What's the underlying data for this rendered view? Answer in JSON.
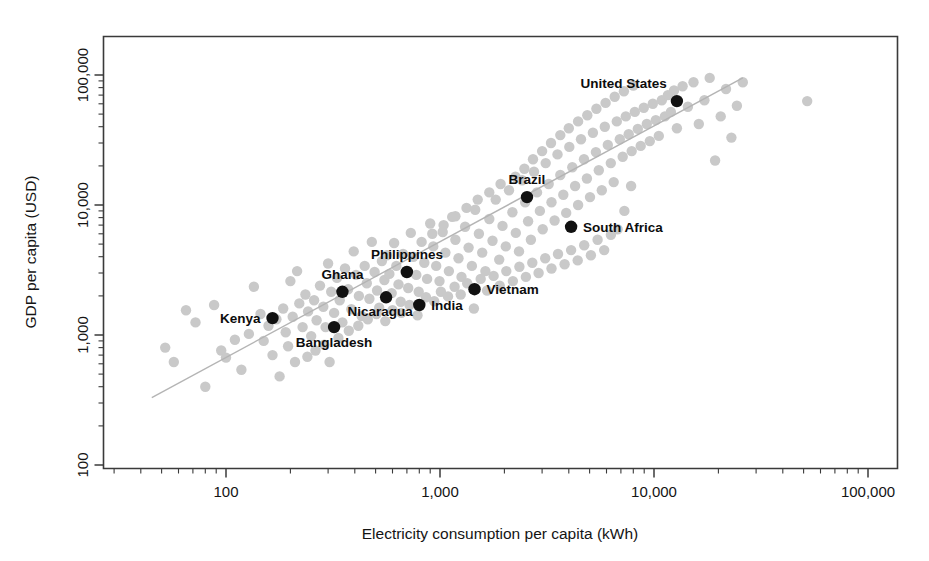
{
  "chart_data": {
    "type": "scatter",
    "title": "",
    "xlabel": "Electricity consumption per capita (kWh)",
    "ylabel": "GDP per capita (USD)",
    "xscale": "log",
    "yscale": "log",
    "xlim": [
      40,
      170000
    ],
    "ylim": [
      150,
      300000
    ],
    "grid": false,
    "legend": null,
    "x_ticks": [
      "100",
      "1,000",
      "10,000",
      "100,000"
    ],
    "x_tick_values": [
      100,
      1000,
      10000,
      100000
    ],
    "y_ticks": [
      "100",
      "1,000",
      "10,000",
      "100,000"
    ],
    "y_tick_values": [
      100,
      1000,
      10000,
      100000
    ],
    "trendline": {
      "note": "straight fitted line on log-log axes",
      "x_start": 45,
      "y_start": 330,
      "x_end": 26000,
      "y_end": 95000,
      "color": "#b4b4b4"
    },
    "series": [
      {
        "name": "Highlighted countries",
        "color": "#111111",
        "marker": "filled-circle",
        "points": [
          {
            "label": "Kenya",
            "x": 165,
            "y": 1350,
            "label_side": "left"
          },
          {
            "label": "Bangladesh",
            "x": 320,
            "y": 1150,
            "label_side": "below"
          },
          {
            "label": "Ghana",
            "x": 350,
            "y": 2150,
            "label_side": "above"
          },
          {
            "label": "Nicaragua",
            "x": 560,
            "y": 1950,
            "label_side": "below-left"
          },
          {
            "label": "India",
            "x": 800,
            "y": 1700,
            "label_side": "right"
          },
          {
            "label": "Philippines",
            "x": 700,
            "y": 3050,
            "label_side": "above"
          },
          {
            "label": "Vietnam",
            "x": 1450,
            "y": 2250,
            "label_side": "right"
          },
          {
            "label": "Brazil",
            "x": 2550,
            "y": 11500,
            "label_side": "above"
          },
          {
            "label": "South Africa",
            "x": 4100,
            "y": 6800,
            "label_side": "right"
          },
          {
            "label": "United States",
            "x": 12800,
            "y": 63000,
            "label_side": "above-left"
          }
        ]
      },
      {
        "name": "All other countries",
        "color": "#c9c9c9",
        "marker": "filled-circle",
        "points": [
          {
            "x": 52,
            "y": 800
          },
          {
            "x": 57,
            "y": 620
          },
          {
            "x": 65,
            "y": 1550
          },
          {
            "x": 72,
            "y": 1250
          },
          {
            "x": 80,
            "y": 400
          },
          {
            "x": 88,
            "y": 1700
          },
          {
            "x": 95,
            "y": 760
          },
          {
            "x": 100,
            "y": 670
          },
          {
            "x": 110,
            "y": 920
          },
          {
            "x": 118,
            "y": 540
          },
          {
            "x": 128,
            "y": 1020
          },
          {
            "x": 135,
            "y": 2350
          },
          {
            "x": 145,
            "y": 1450
          },
          {
            "x": 150,
            "y": 900
          },
          {
            "x": 158,
            "y": 1180
          },
          {
            "x": 165,
            "y": 700
          },
          {
            "x": 172,
            "y": 1320
          },
          {
            "x": 178,
            "y": 480
          },
          {
            "x": 185,
            "y": 1600
          },
          {
            "x": 190,
            "y": 1050
          },
          {
            "x": 200,
            "y": 2600
          },
          {
            "x": 205,
            "y": 1380
          },
          {
            "x": 215,
            "y": 3100
          },
          {
            "x": 220,
            "y": 1750
          },
          {
            "x": 228,
            "y": 1150
          },
          {
            "x": 235,
            "y": 2050
          },
          {
            "x": 242,
            "y": 1520
          },
          {
            "x": 250,
            "y": 980
          },
          {
            "x": 258,
            "y": 1850
          },
          {
            "x": 265,
            "y": 1300
          },
          {
            "x": 275,
            "y": 2400
          },
          {
            "x": 285,
            "y": 1650
          },
          {
            "x": 292,
            "y": 1150
          },
          {
            "x": 300,
            "y": 3550
          },
          {
            "x": 310,
            "y": 2150
          },
          {
            "x": 320,
            "y": 1480
          },
          {
            "x": 330,
            "y": 2750
          },
          {
            "x": 340,
            "y": 1850
          },
          {
            "x": 350,
            "y": 1250
          },
          {
            "x": 360,
            "y": 3250
          },
          {
            "x": 372,
            "y": 2250
          },
          {
            "x": 385,
            "y": 1580
          },
          {
            "x": 395,
            "y": 4400
          },
          {
            "x": 405,
            "y": 2900
          },
          {
            "x": 418,
            "y": 2000
          },
          {
            "x": 430,
            "y": 1400
          },
          {
            "x": 445,
            "y": 3400
          },
          {
            "x": 455,
            "y": 2500
          },
          {
            "x": 468,
            "y": 1900
          },
          {
            "x": 480,
            "y": 5200
          },
          {
            "x": 495,
            "y": 3050
          },
          {
            "x": 508,
            "y": 2200
          },
          {
            "x": 520,
            "y": 1620
          },
          {
            "x": 535,
            "y": 3700
          },
          {
            "x": 550,
            "y": 2650
          },
          {
            "x": 565,
            "y": 4100
          },
          {
            "x": 580,
            "y": 2950
          },
          {
            "x": 595,
            "y": 2100
          },
          {
            "x": 610,
            "y": 5100
          },
          {
            "x": 625,
            "y": 3400
          },
          {
            "x": 640,
            "y": 2450
          },
          {
            "x": 655,
            "y": 1800
          },
          {
            "x": 672,
            "y": 4200
          },
          {
            "x": 690,
            "y": 3050
          },
          {
            "x": 710,
            "y": 2300
          },
          {
            "x": 730,
            "y": 6100
          },
          {
            "x": 750,
            "y": 4000
          },
          {
            "x": 775,
            "y": 2900
          },
          {
            "x": 795,
            "y": 2150
          },
          {
            "x": 820,
            "y": 5200
          },
          {
            "x": 845,
            "y": 3600
          },
          {
            "x": 870,
            "y": 2700
          },
          {
            "x": 900,
            "y": 7200
          },
          {
            "x": 930,
            "y": 4800
          },
          {
            "x": 960,
            "y": 3400
          },
          {
            "x": 995,
            "y": 2600
          },
          {
            "x": 1030,
            "y": 6200
          },
          {
            "x": 1060,
            "y": 4300
          },
          {
            "x": 1100,
            "y": 3100
          },
          {
            "x": 1140,
            "y": 8100
          },
          {
            "x": 1180,
            "y": 5400
          },
          {
            "x": 1220,
            "y": 3900
          },
          {
            "x": 1260,
            "y": 2800
          },
          {
            "x": 1310,
            "y": 6800
          },
          {
            "x": 1360,
            "y": 4700
          },
          {
            "x": 1410,
            "y": 3400
          },
          {
            "x": 1460,
            "y": 9200
          },
          {
            "x": 1520,
            "y": 6000
          },
          {
            "x": 1575,
            "y": 4300
          },
          {
            "x": 1630,
            "y": 3100
          },
          {
            "x": 1700,
            "y": 7800
          },
          {
            "x": 1760,
            "y": 5300
          },
          {
            "x": 1820,
            "y": 11000
          },
          {
            "x": 1890,
            "y": 3800
          },
          {
            "x": 1960,
            "y": 6900
          },
          {
            "x": 2030,
            "y": 4800
          },
          {
            "x": 2100,
            "y": 13000
          },
          {
            "x": 2180,
            "y": 8800
          },
          {
            "x": 2260,
            "y": 6100
          },
          {
            "x": 2340,
            "y": 4400
          },
          {
            "x": 2420,
            "y": 15500
          },
          {
            "x": 2500,
            "y": 10500
          },
          {
            "x": 2580,
            "y": 7500
          },
          {
            "x": 2660,
            "y": 5400
          },
          {
            "x": 2750,
            "y": 18000
          },
          {
            "x": 2840,
            "y": 12500
          },
          {
            "x": 2930,
            "y": 9000
          },
          {
            "x": 3020,
            "y": 6500
          },
          {
            "x": 3120,
            "y": 21000
          },
          {
            "x": 3220,
            "y": 14500
          },
          {
            "x": 3320,
            "y": 10500
          },
          {
            "x": 3430,
            "y": 7600
          },
          {
            "x": 3540,
            "y": 24500
          },
          {
            "x": 3650,
            "y": 17000
          },
          {
            "x": 3770,
            "y": 12000
          },
          {
            "x": 3890,
            "y": 8700
          },
          {
            "x": 4020,
            "y": 28000
          },
          {
            "x": 4150,
            "y": 19500
          },
          {
            "x": 4280,
            "y": 14000
          },
          {
            "x": 4420,
            "y": 10000
          },
          {
            "x": 4560,
            "y": 32000
          },
          {
            "x": 4710,
            "y": 22500
          },
          {
            "x": 4860,
            "y": 16000
          },
          {
            "x": 5020,
            "y": 11500
          },
          {
            "x": 5180,
            "y": 36000
          },
          {
            "x": 5350,
            "y": 25500
          },
          {
            "x": 5520,
            "y": 18500
          },
          {
            "x": 5700,
            "y": 13000
          },
          {
            "x": 5890,
            "y": 40000
          },
          {
            "x": 6080,
            "y": 29000
          },
          {
            "x": 6280,
            "y": 21000
          },
          {
            "x": 6480,
            "y": 15000
          },
          {
            "x": 6700,
            "y": 44000
          },
          {
            "x": 6920,
            "y": 32000
          },
          {
            "x": 7140,
            "y": 23500
          },
          {
            "x": 7380,
            "y": 48000
          },
          {
            "x": 7620,
            "y": 35000
          },
          {
            "x": 7870,
            "y": 26000
          },
          {
            "x": 8130,
            "y": 52000
          },
          {
            "x": 8400,
            "y": 38500
          },
          {
            "x": 8670,
            "y": 28500
          },
          {
            "x": 8960,
            "y": 56000
          },
          {
            "x": 9250,
            "y": 42000
          },
          {
            "x": 9560,
            "y": 31000
          },
          {
            "x": 9870,
            "y": 60000
          },
          {
            "x": 10200,
            "y": 45000
          },
          {
            "x": 10530,
            "y": 34000
          },
          {
            "x": 10880,
            "y": 64000
          },
          {
            "x": 11240,
            "y": 48000
          },
          {
            "x": 11610,
            "y": 70000
          },
          {
            "x": 12000,
            "y": 52000
          },
          {
            "x": 12400,
            "y": 76000
          },
          {
            "x": 12800,
            "y": 39000
          },
          {
            "x": 13600,
            "y": 82000
          },
          {
            "x": 14400,
            "y": 57000
          },
          {
            "x": 15300,
            "y": 88000
          },
          {
            "x": 16200,
            "y": 42000
          },
          {
            "x": 17200,
            "y": 64000
          },
          {
            "x": 18200,
            "y": 95000
          },
          {
            "x": 19300,
            "y": 22000
          },
          {
            "x": 20500,
            "y": 48000
          },
          {
            "x": 21700,
            "y": 78000
          },
          {
            "x": 23000,
            "y": 33000
          },
          {
            "x": 24400,
            "y": 58000
          },
          {
            "x": 26000,
            "y": 88000
          },
          {
            "x": 52000,
            "y": 63000
          },
          {
            "x": 240,
            "y": 680
          },
          {
            "x": 262,
            "y": 760
          },
          {
            "x": 288,
            "y": 840
          },
          {
            "x": 305,
            "y": 620
          },
          {
            "x": 195,
            "y": 820
          },
          {
            "x": 210,
            "y": 620
          },
          {
            "x": 335,
            "y": 950
          },
          {
            "x": 375,
            "y": 1080
          },
          {
            "x": 415,
            "y": 1180
          },
          {
            "x": 460,
            "y": 1320
          },
          {
            "x": 505,
            "y": 1450
          },
          {
            "x": 555,
            "y": 1280
          },
          {
            "x": 600,
            "y": 1550
          },
          {
            "x": 660,
            "y": 1480
          },
          {
            "x": 720,
            "y": 1700
          },
          {
            "x": 785,
            "y": 1420
          },
          {
            "x": 860,
            "y": 1950
          },
          {
            "x": 940,
            "y": 1820
          },
          {
            "x": 1010,
            "y": 2150
          },
          {
            "x": 1090,
            "y": 1980
          },
          {
            "x": 1170,
            "y": 2350
          },
          {
            "x": 1250,
            "y": 2050
          },
          {
            "x": 1340,
            "y": 2500
          },
          {
            "x": 1440,
            "y": 1600
          },
          {
            "x": 1550,
            "y": 2700
          },
          {
            "x": 1660,
            "y": 2200
          },
          {
            "x": 1780,
            "y": 2850
          },
          {
            "x": 1900,
            "y": 2400
          },
          {
            "x": 2040,
            "y": 3100
          },
          {
            "x": 2190,
            "y": 2600
          },
          {
            "x": 2350,
            "y": 3350
          },
          {
            "x": 2520,
            "y": 2800
          },
          {
            "x": 2700,
            "y": 3600
          },
          {
            "x": 2890,
            "y": 3000
          },
          {
            "x": 3100,
            "y": 3900
          },
          {
            "x": 3320,
            "y": 3250
          },
          {
            "x": 3560,
            "y": 4200
          },
          {
            "x": 3820,
            "y": 3500
          },
          {
            "x": 4100,
            "y": 4500
          },
          {
            "x": 4400,
            "y": 3750
          },
          {
            "x": 4720,
            "y": 4900
          },
          {
            "x": 5070,
            "y": 4100
          },
          {
            "x": 5450,
            "y": 5400
          },
          {
            "x": 5850,
            "y": 4500
          },
          {
            "x": 6290,
            "y": 5900
          },
          {
            "x": 6760,
            "y": 6500
          },
          {
            "x": 7270,
            "y": 9000
          },
          {
            "x": 7820,
            "y": 14000
          },
          {
            "x": 2250,
            "y": 16500
          },
          {
            "x": 2480,
            "y": 19000
          },
          {
            "x": 2720,
            "y": 22500
          },
          {
            "x": 3000,
            "y": 26000
          },
          {
            "x": 3300,
            "y": 30000
          },
          {
            "x": 3650,
            "y": 34500
          },
          {
            "x": 4000,
            "y": 39000
          },
          {
            "x": 4420,
            "y": 44000
          },
          {
            "x": 4880,
            "y": 49000
          },
          {
            "x": 5380,
            "y": 55000
          },
          {
            "x": 5940,
            "y": 61000
          },
          {
            "x": 6550,
            "y": 68000
          },
          {
            "x": 7230,
            "y": 75000
          },
          {
            "x": 8000,
            "y": 83000
          },
          {
            "x": 1920,
            "y": 14500
          },
          {
            "x": 1700,
            "y": 12500
          },
          {
            "x": 1500,
            "y": 11000
          },
          {
            "x": 1330,
            "y": 9500
          },
          {
            "x": 1180,
            "y": 8200
          },
          {
            "x": 1040,
            "y": 7000
          },
          {
            "x": 920,
            "y": 6000
          }
        ]
      }
    ]
  },
  "axes": {
    "x_label": "Electricity consumption per capita (kWh)",
    "y_label": "GDP per capita (USD)",
    "x_tick_labels": [
      "100",
      "1,000",
      "10,000",
      "100,000"
    ],
    "y_tick_labels": [
      "100",
      "1,000",
      "10,000",
      "100,000"
    ]
  },
  "colors": {
    "highlight_point": "#111111",
    "other_point": "#c9c9c9",
    "trendline": "#b4b4b4",
    "frame": "#3a3a3a",
    "background": "#ffffff"
  }
}
